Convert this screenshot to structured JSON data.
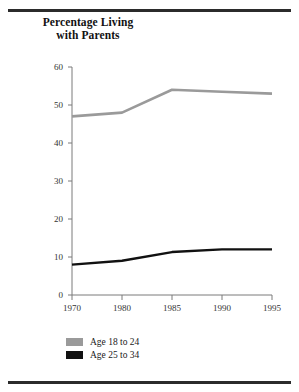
{
  "figure": {
    "title_line1": "Percentage Living",
    "title_line2": "with Parents"
  },
  "legend": {
    "items": [
      {
        "label": "Age 18 to 24",
        "color": "#9a9a9a",
        "swatch": "legend-swatch-gray"
      },
      {
        "label": "Age 25 to 34",
        "color": "#111111",
        "swatch": "legend-swatch-black"
      }
    ]
  },
  "axis": {
    "y_ticks": [
      "60",
      "50",
      "40",
      "30",
      "20",
      "10",
      "0"
    ],
    "x_ticks": [
      "1970",
      "1980",
      "1985",
      "1990",
      "1995"
    ]
  },
  "chart_data": {
    "type": "line",
    "title": "Percentage Living with Parents",
    "xlabel": "",
    "ylabel": "",
    "categories": [
      "1970",
      "1980",
      "1985",
      "1990",
      "1995"
    ],
    "series": [
      {
        "name": "Age 18 to 24",
        "color": "#9a9a9a",
        "values": [
          47,
          48,
          54,
          53.5,
          53
        ]
      },
      {
        "name": "Age 25 to 34",
        "color": "#111111",
        "values": [
          8,
          9,
          11.3,
          12,
          12
        ]
      }
    ],
    "ylim": [
      0,
      60
    ],
    "ytick_step": 10,
    "grid": false,
    "legend_position": "bottom-left"
  }
}
